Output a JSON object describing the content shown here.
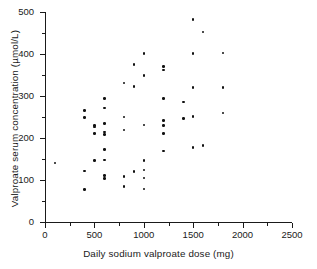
{
  "chart_data": {
    "type": "scatter",
    "title": "",
    "xlabel": "Daily sodium valproate dose (mg)",
    "ylabel": "Valproate serum concentration (µmol/L)",
    "xlim": [
      0,
      2500
    ],
    "ylim": [
      0,
      500
    ],
    "xticks": [
      0,
      500,
      1000,
      1500,
      2000,
      2500
    ],
    "yticks": [
      0,
      100,
      200,
      300,
      400,
      500
    ],
    "xtick_labels": [
      "0",
      "500",
      "1000",
      "1500",
      "2000",
      "2500"
    ],
    "ytick_labels": [
      "0",
      "100",
      "200",
      "300",
      "400",
      "500"
    ],
    "xminor_step": 250,
    "yminor_step": 50,
    "grid": false,
    "legend": null,
    "spines": [
      "left",
      "bottom"
    ],
    "marker": "filled-circle",
    "marker_color": "#111111",
    "background": "#ffffff",
    "points": [
      {
        "x": 100,
        "y": 140
      },
      {
        "x": 400,
        "y": 265
      },
      {
        "x": 400,
        "y": 249
      },
      {
        "x": 400,
        "y": 121
      },
      {
        "x": 400,
        "y": 77
      },
      {
        "x": 500,
        "y": 230
      },
      {
        "x": 500,
        "y": 226
      },
      {
        "x": 500,
        "y": 211
      },
      {
        "x": 500,
        "y": 146
      },
      {
        "x": 600,
        "y": 294
      },
      {
        "x": 600,
        "y": 271
      },
      {
        "x": 600,
        "y": 234
      },
      {
        "x": 600,
        "y": 214
      },
      {
        "x": 600,
        "y": 209
      },
      {
        "x": 600,
        "y": 173
      },
      {
        "x": 600,
        "y": 148
      },
      {
        "x": 600,
        "y": 111
      },
      {
        "x": 600,
        "y": 104
      },
      {
        "x": 800,
        "y": 331
      },
      {
        "x": 800,
        "y": 250
      },
      {
        "x": 800,
        "y": 219
      },
      {
        "x": 800,
        "y": 109
      },
      {
        "x": 800,
        "y": 84
      },
      {
        "x": 900,
        "y": 375
      },
      {
        "x": 900,
        "y": 322
      },
      {
        "x": 900,
        "y": 120
      },
      {
        "x": 1000,
        "y": 401
      },
      {
        "x": 1000,
        "y": 349
      },
      {
        "x": 1000,
        "y": 231
      },
      {
        "x": 1000,
        "y": 146
      },
      {
        "x": 1000,
        "y": 124
      },
      {
        "x": 1000,
        "y": 105
      },
      {
        "x": 1000,
        "y": 79
      },
      {
        "x": 1200,
        "y": 370
      },
      {
        "x": 1200,
        "y": 362
      },
      {
        "x": 1200,
        "y": 294
      },
      {
        "x": 1200,
        "y": 241
      },
      {
        "x": 1200,
        "y": 230
      },
      {
        "x": 1200,
        "y": 211
      },
      {
        "x": 1200,
        "y": 169
      },
      {
        "x": 1400,
        "y": 286
      },
      {
        "x": 1400,
        "y": 247
      },
      {
        "x": 1500,
        "y": 482
      },
      {
        "x": 1500,
        "y": 401
      },
      {
        "x": 1500,
        "y": 320
      },
      {
        "x": 1500,
        "y": 251
      },
      {
        "x": 1500,
        "y": 178
      },
      {
        "x": 1600,
        "y": 452
      },
      {
        "x": 1600,
        "y": 182
      },
      {
        "x": 1800,
        "y": 402
      },
      {
        "x": 1800,
        "y": 320
      },
      {
        "x": 1800,
        "y": 260
      }
    ]
  }
}
